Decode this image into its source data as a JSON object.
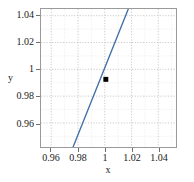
{
  "chart_data": {
    "type": "line",
    "title": "",
    "xlabel": "x",
    "ylabel": "y",
    "xlim": [
      0.9515,
      1.0525
    ],
    "ylim": [
      0.9495,
      1.0525
    ],
    "xticks": [
      0.96,
      0.98,
      1,
      1.02,
      1.04
    ],
    "xtick_labels": [
      "0.96",
      "0.98",
      "1",
      "1.02",
      "1.04"
    ],
    "yticks": [
      0.96,
      0.98,
      1,
      1.02,
      1.04
    ],
    "ytick_labels": [
      "0.96",
      "0.98",
      "1",
      "1.02",
      "1.04"
    ],
    "grid": true,
    "grid_style": "dotted",
    "minor_grid": true,
    "legend": null,
    "series": [
      {
        "name": "line",
        "type": "line",
        "color": "#4472a8",
        "linewidth": 1.4,
        "slope": 1.77,
        "intercept": -0.77,
        "points": [
          {
            "x": 0.9755,
            "y": 0.9495
          },
          {
            "x": 1.0,
            "y": 1.0
          },
          {
            "x": 1.0168,
            "y": 1.0525
          }
        ]
      },
      {
        "name": "marker",
        "type": "scatter",
        "color": "#000000",
        "marker": "square",
        "size": 5,
        "points": [
          {
            "x": 1.0,
            "y": 1.0
          }
        ]
      }
    ]
  },
  "axis_colors": {
    "frame": "#9a9a9a",
    "grid": "#c8c8c8",
    "minor_grid": "#dcdcdc",
    "text": "#1a1a1a",
    "line": "#4472a8",
    "marker": "#000000"
  }
}
